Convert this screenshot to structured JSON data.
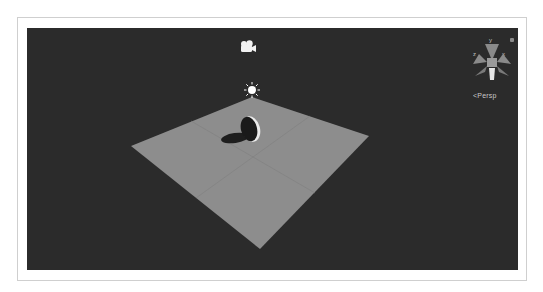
{
  "scene_view": {
    "background_color": "#2b2b2b",
    "plane_color": "#8c8c8c",
    "objects": [
      {
        "name": "Camera",
        "icon": "camera-icon"
      },
      {
        "name": "Directional Light",
        "icon": "sun-icon"
      },
      {
        "name": "Plane",
        "icon": "plane-mesh"
      },
      {
        "name": "Disc",
        "icon": "disc-mesh"
      }
    ]
  },
  "gizmo": {
    "axis_y": "y",
    "axis_x": "x",
    "axis_z": "z",
    "projection_label": "<Persp"
  }
}
